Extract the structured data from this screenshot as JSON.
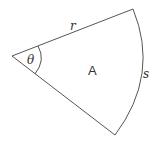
{
  "diagram": {
    "type": "circular-sector",
    "labels": {
      "radius": "r",
      "angle": "θ",
      "area": "A",
      "arc": "s"
    },
    "colors": {
      "stroke": "#555555",
      "text": "#333333",
      "background": "#ffffff"
    }
  }
}
